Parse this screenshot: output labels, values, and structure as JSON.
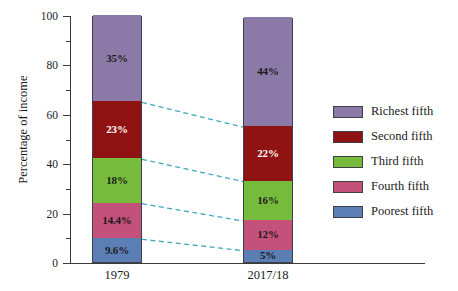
{
  "chart_data": {
    "type": "bar",
    "stacked": true,
    "title": "",
    "xlabel": "",
    "ylabel": "Percentage of income",
    "ylim": [
      0,
      100
    ],
    "ytick_labels": [
      "0",
      "20",
      "40",
      "60",
      "80",
      "100"
    ],
    "ytick_values": [
      0,
      20,
      40,
      60,
      80,
      100
    ],
    "yminor_values": [
      10,
      30,
      50,
      70,
      90
    ],
    "grid": false,
    "legend_position": "right",
    "categories": [
      "1979",
      "2017/18"
    ],
    "series": [
      {
        "name": "Richest fifth",
        "color": "#8b7aa8",
        "values": [
          35,
          44
        ],
        "labels": [
          "35%",
          "44%"
        ],
        "label_color": [
          "#1b1b1b",
          "#1b1b1b"
        ]
      },
      {
        "name": "Second fifth",
        "color": "#8f1313",
        "values": [
          23,
          22
        ],
        "labels": [
          "23%",
          "22%"
        ],
        "label_color": [
          "#ffffff",
          "#ffffff"
        ]
      },
      {
        "name": "Third fifth",
        "color": "#76bb3c",
        "values": [
          18,
          16
        ],
        "labels": [
          "18%",
          "16%"
        ],
        "label_color": [
          "#1b1b1b",
          "#1b1b1b"
        ]
      },
      {
        "name": "Fourth fifth",
        "color": "#c3517a",
        "values": [
          14.4,
          12
        ],
        "labels": [
          "14.4%",
          "12%"
        ],
        "label_color": [
          "#1b1b1b",
          "#1b1b1b"
        ]
      },
      {
        "name": "Poorest fifth",
        "color": "#5b7fb4",
        "values": [
          9.6,
          5
        ],
        "labels": [
          "9.6%",
          "5%"
        ],
        "label_color": [
          "#1b1b1b",
          "#1b1b1b"
        ]
      }
    ],
    "connector_color": "#3fa9bd",
    "connector_style": "dashed",
    "connector_count": 4
  },
  "axis": {
    "y_title": "Percentage of income",
    "y_ticks": [
      "100",
      "80",
      "60",
      "40",
      "20",
      "0"
    ],
    "x_ticks": [
      "1979",
      "2017/18"
    ]
  },
  "legend": {
    "items": [
      {
        "label": "Richest fifth",
        "color": "#8b7aa8"
      },
      {
        "label": "Second fifth",
        "color": "#8f1313"
      },
      {
        "label": "Third fifth",
        "color": "#76bb3c"
      },
      {
        "label": "Fourth fifth",
        "color": "#c3517a"
      },
      {
        "label": "Poorest fifth",
        "color": "#5b7fb4"
      }
    ]
  }
}
